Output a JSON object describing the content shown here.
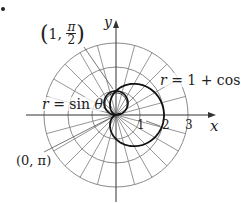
{
  "figure": {
    "origin_px": [
      116,
      115
    ],
    "scale_px_per_unit": 24,
    "colors": {
      "grid": "#8a8a8a",
      "axis": "#333333",
      "curve": "#111111",
      "text": "#222222"
    }
  },
  "chart_data": {
    "type": "polar-diagram",
    "title": "",
    "grid": {
      "radii": [
        1,
        2,
        3
      ],
      "ray_step_deg": 15,
      "on": true
    },
    "axes": {
      "x": {
        "label": "x",
        "ticks": [
          1,
          2,
          3
        ],
        "range": [
          -3.75,
          6.7
        ]
      },
      "y": {
        "label": "y",
        "range": [
          -3.5,
          3.9
        ]
      }
    },
    "curves": [
      {
        "name": "r = sin θ",
        "equation": "r = sin(theta)",
        "theta_range": [
          0,
          3.14159
        ]
      },
      {
        "name": "r = 1 + cos θ",
        "equation": "r = 1 + cos(theta)",
        "theta_range": [
          0,
          6.28318
        ]
      }
    ],
    "annotations": [
      {
        "text": "(1, π/2)",
        "points_to": [
          0,
          1
        ]
      },
      {
        "text": "(0, π)",
        "points_to": [
          0,
          0
        ]
      }
    ]
  },
  "labels": {
    "bullet": "•",
    "y_axis": "y",
    "x_axis": "x",
    "ticks": [
      "1",
      "2",
      "3"
    ],
    "point_top": {
      "open": "(",
      "r": "1,",
      "num": "π",
      "den": "2",
      "close": ")"
    },
    "point_origin": "(0, π)",
    "curve_sin": {
      "r": "r",
      "rest": " = sin ",
      "theta": "θ"
    },
    "curve_card": {
      "r": "r",
      "rest": " = 1 + cos ",
      "theta": "θ"
    }
  }
}
